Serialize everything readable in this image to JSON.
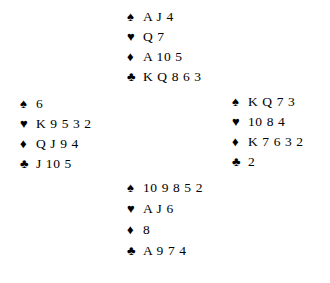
{
  "diagram": {
    "type": "bridge-hand-diagram",
    "background_color": "#ffffff",
    "text_color": "#000000",
    "suit_symbols": {
      "spade": "♠",
      "heart": "♥",
      "diamond": "♦",
      "club": "♣"
    },
    "hands": {
      "north": {
        "position_label": "North",
        "spades": "A J 4",
        "hearts": "Q 7",
        "diamonds": "A 10 5",
        "clubs": "K Q 8 6 3"
      },
      "west": {
        "position_label": "West",
        "spades": "6",
        "hearts": "K 9 5 3 2",
        "diamonds": "Q J 9 4",
        "clubs": "J 10 5"
      },
      "east": {
        "position_label": "East",
        "spades": "K Q 7 3",
        "hearts": "10 8 4",
        "diamonds": "K 7 6 3 2",
        "clubs": "2"
      },
      "south": {
        "position_label": "South",
        "spades": "10 9 8 5 2",
        "hearts": "A J 6",
        "diamonds": "8",
        "clubs": "A 9 7 4"
      }
    }
  }
}
